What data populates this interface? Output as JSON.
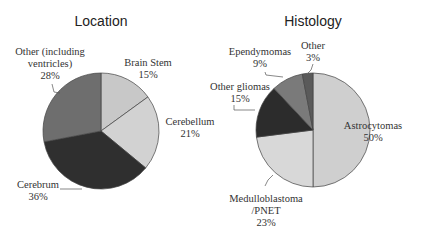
{
  "chart_data": [
    {
      "type": "pie",
      "title": "Location",
      "slices": [
        {
          "label": "Brain Stem",
          "value": 15,
          "color": "#c8c8c8"
        },
        {
          "label": "Cerebellum",
          "value": 21,
          "color": "#d2d2d2"
        },
        {
          "label": "Cerebrum",
          "value": 36,
          "color": "#2f2f2f"
        },
        {
          "label": "Other (including ventricles)",
          "value": 28,
          "color": "#6e6e6e"
        }
      ]
    },
    {
      "type": "pie",
      "title": "Histology",
      "slices": [
        {
          "label": "Astrocytomas",
          "value": 50,
          "color": "#cfcfcf"
        },
        {
          "label": "Medulloblastoma /PNET",
          "value": 23,
          "color": "#d8d8d8"
        },
        {
          "label": "Other gliomas",
          "value": 15,
          "color": "#2c2c2c"
        },
        {
          "label": "Ependymomas",
          "value": 9,
          "color": "#7a7a7a"
        },
        {
          "label": "Other",
          "value": 3,
          "color": "#5a5a5a"
        }
      ]
    }
  ],
  "labels": {
    "left_title": "Location",
    "right_title": "Histology",
    "brain_stem": "Brain Stem",
    "brain_stem_pct": "15%",
    "cerebellum": "Cerebellum",
    "cerebellum_pct": "21%",
    "cerebrum": "Cerebrum",
    "cerebrum_pct": "36%",
    "other_loc_1": "Other (including",
    "other_loc_2": "ventricles)",
    "other_loc_pct": "28%",
    "astro": "Astrocytomas",
    "astro_pct": "50%",
    "medullo_1": "Medulloblastoma",
    "medullo_2": "/PNET",
    "medullo_pct": "23%",
    "gliomas": "Other gliomas",
    "gliomas_pct": "15%",
    "ependy": "Ependymomas",
    "ependy_pct": "9%",
    "other_hist": "Other",
    "other_hist_pct": "3%"
  }
}
